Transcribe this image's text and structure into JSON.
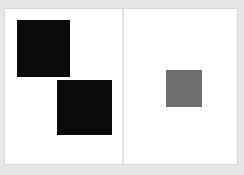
{
  "canvas": {
    "background_color": "#e7e7e7",
    "width": 244,
    "height": 175,
    "label": "Light gray canvas backdrop"
  },
  "spread": {
    "name": "two-page-spread",
    "background_color": "#ffffff",
    "gutter_color": "#e2e2e2",
    "gutter_label": "Center fold divider",
    "pages": [
      {
        "id": "left",
        "label": "Left page",
        "shapes": [
          {
            "id": "black-square-upper-left",
            "label": "Large black square",
            "fill": "#0a0a0a",
            "shape": "square",
            "x": 12,
            "y": 11,
            "width": 53,
            "height": 57
          },
          {
            "id": "black-square-lower-center",
            "label": "Large black square",
            "fill": "#0a0a0a",
            "shape": "square",
            "x": 52,
            "y": 71,
            "width": 55,
            "height": 55
          }
        ]
      },
      {
        "id": "right",
        "label": "Right page",
        "shapes": [
          {
            "id": "gray-square-center",
            "label": "Medium gray square",
            "fill": "#6f6f6f",
            "shape": "square",
            "x": 42,
            "y": 61,
            "width": 36,
            "height": 37
          }
        ]
      }
    ]
  }
}
